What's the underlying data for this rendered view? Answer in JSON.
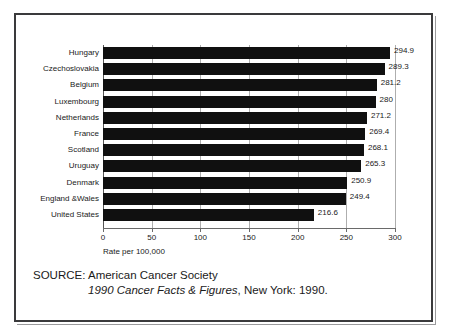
{
  "chart_data": {
    "type": "bar",
    "orientation": "horizontal",
    "title": "",
    "xlabel": "Rate per 100,000",
    "ylabel": "",
    "xlim": [
      0,
      300
    ],
    "xticks": [
      0,
      50,
      100,
      150,
      200,
      250,
      300
    ],
    "xtick_labels": [
      "0",
      "50",
      "100",
      "150",
      "200",
      "250",
      "300"
    ],
    "grid": true,
    "grid_axis": "x",
    "legend": false,
    "bar_color": "#101010",
    "categories": [
      "Hungary",
      "Czechoslovakia",
      "Belgium",
      "Luxembourg",
      "Netherlands",
      "France",
      "Scotland",
      "Uruguay",
      "Denmark",
      "England &Wales",
      "United States"
    ],
    "values": [
      294.9,
      289.3,
      281.2,
      280,
      271.2,
      269.4,
      268.1,
      265.3,
      250.9,
      249.4,
      216.6
    ],
    "value_labels": [
      "294.9",
      "289.3",
      "281.2",
      "280",
      "271.2",
      "269.4",
      "268.1",
      "265.3",
      "250.9",
      "249.4",
      "216.6"
    ]
  },
  "source": {
    "line1": "SOURCE: American Cancer Society",
    "line2_italic": "1990 Cancer Facts & Figures",
    "line2_rest": ", New York: 1990."
  }
}
